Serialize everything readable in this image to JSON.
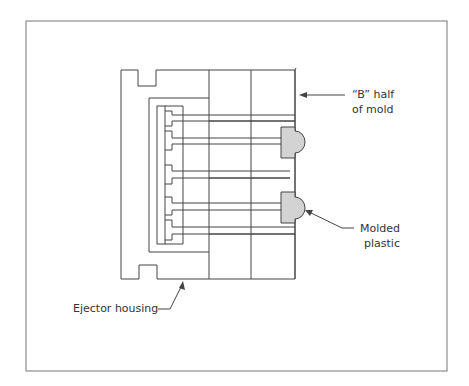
{
  "diagram": {
    "type": "injection-mold-ejector-cross-section",
    "colors": {
      "line": "#444444",
      "molded_part_fill": "#d3d3d3",
      "frame": "#777777",
      "background": "#ffffff"
    },
    "labels": {
      "b_half_line1": "“B” half",
      "b_half_line2": "of mold",
      "molded_line1": "Molded",
      "molded_line2": "plastic",
      "ejector_housing": "Ejector housing"
    },
    "components": [
      "ejector-housing",
      "b-half-of-mold",
      "ejector-plate",
      "ejector-pins",
      "molded-plastic-parts"
    ]
  }
}
